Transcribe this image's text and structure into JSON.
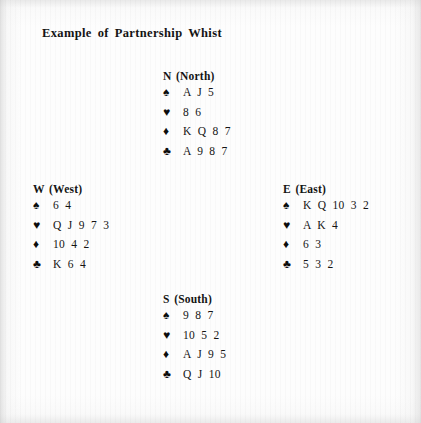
{
  "document": {
    "title": "Example of Partnership Whist"
  },
  "suits": {
    "spade": {
      "name": "spade-icon",
      "glyph": "♠"
    },
    "heart": {
      "name": "heart-icon",
      "glyph": "♥"
    },
    "diamond": {
      "name": "diamond-icon",
      "glyph": "♦"
    },
    "club": {
      "name": "club-icon",
      "glyph": "♣"
    }
  },
  "hands": {
    "north": {
      "label": "N (North)",
      "spades": "A J 5",
      "hearts": "8 6",
      "diamonds": "K Q 8 7",
      "clubs": "A 9 8 7"
    },
    "west": {
      "label": "W (West)",
      "spades": "6 4",
      "hearts": "Q J 9 7 3",
      "diamonds": "10 4 2",
      "clubs": "K 6 4"
    },
    "east": {
      "label": "E (East)",
      "spades": "K Q 10 3 2",
      "hearts": "A K 4",
      "diamonds": "6 3",
      "clubs": "5 3 2"
    },
    "south": {
      "label": "S (South)",
      "spades": "9 8 7",
      "hearts": "10 5 2",
      "diamonds": "A J 9 5",
      "clubs": "Q J 10"
    }
  },
  "colors": {
    "ink": "#141414",
    "paper": "#fdfdfd"
  }
}
